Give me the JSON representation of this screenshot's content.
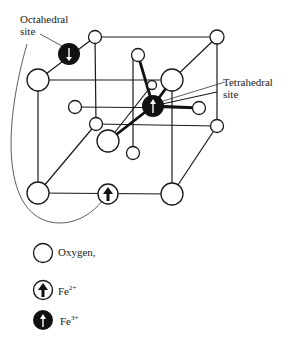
{
  "diagram": {
    "labels": {
      "octahedral": [
        "Octahedral",
        "site"
      ],
      "tetrahedral": [
        "Tetrahedral",
        "site"
      ]
    },
    "legend": [
      {
        "symbol": "open-circle",
        "text": "Oxygen,"
      },
      {
        "symbol": "circle-thick-up-arrow",
        "text": "Fe",
        "superscript": "2+"
      },
      {
        "symbol": "filled-circle-up-arrow",
        "text": "Fe",
        "superscript": "3+"
      }
    ],
    "colors": {
      "line": "#1a1a1a",
      "fill_dark": "#111111",
      "background": "#ffffff"
    }
  }
}
